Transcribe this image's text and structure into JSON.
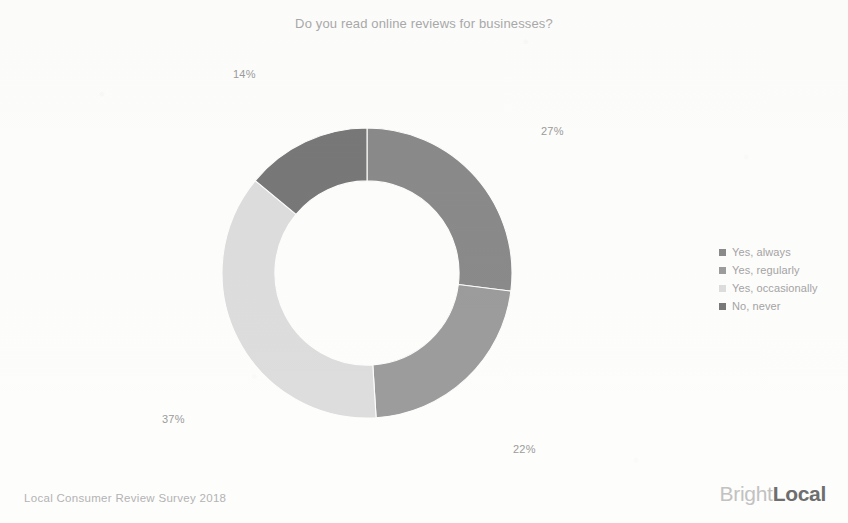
{
  "title": "Do you read online reviews for businesses?",
  "source_note": "Local Consumer Review Survey 2018",
  "brand": {
    "part1": "Bright",
    "part2": "Local"
  },
  "legend": {
    "position": "right",
    "items": [
      {
        "label": "Yes, always",
        "color": "#8a8a8a"
      },
      {
        "label": "Yes, regularly",
        "color": "#9c9c9c"
      },
      {
        "label": "Yes, occasionally",
        "color": "#dddddd"
      },
      {
        "label": "No, never",
        "color": "#787878"
      }
    ]
  },
  "labels": {
    "always": "27%",
    "regularly": "22%",
    "occasionally": "37%",
    "never": "14%"
  },
  "chart_data": {
    "type": "pie",
    "variant": "donut",
    "title": "Do you read online reviews for businesses?",
    "xlabel": "",
    "ylabel": "",
    "units": "percent",
    "total": 100,
    "start_angle_deg": 0,
    "direction": "clockwise",
    "inner_radius_ratio": 0.635,
    "categories": [
      "Yes, always",
      "Yes, regularly",
      "Yes, occasionally",
      "No, never"
    ],
    "values": [
      27,
      22,
      37,
      14
    ],
    "value_labels": [
      "27%",
      "22%",
      "37%",
      "14%"
    ],
    "colors": [
      "#8a8a8a",
      "#9c9c9c",
      "#dddddd",
      "#787878"
    ],
    "legend_position": "right",
    "grid": false,
    "slices": [
      {
        "name": "Yes, always",
        "value": 27,
        "label": "27%",
        "color": "#8a8a8a",
        "start_deg": 0,
        "end_deg": 97.2
      },
      {
        "name": "Yes, regularly",
        "value": 22,
        "label": "22%",
        "color": "#9c9c9c",
        "start_deg": 97.2,
        "end_deg": 176.4
      },
      {
        "name": "Yes, occasionally",
        "value": 37,
        "label": "37%",
        "color": "#dddddd",
        "start_deg": 176.4,
        "end_deg": 309.6
      },
      {
        "name": "No, never",
        "value": 14,
        "label": "14%",
        "color": "#787878",
        "start_deg": 309.6,
        "end_deg": 360
      }
    ]
  }
}
